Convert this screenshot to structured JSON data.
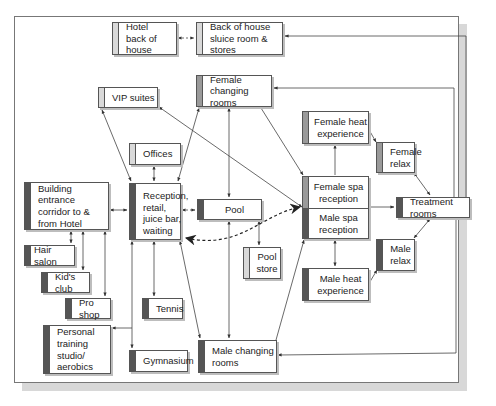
{
  "diagram": {
    "colors": {
      "bar_light": "#d9d9d9",
      "bar_mid": "#9a9a9a",
      "bar_dark": "#555555",
      "line": "#444444"
    },
    "nodes": {
      "hotel_boh": "Hotel\nback of house",
      "boh_sluice": "Back of house\nsluice room & stores",
      "vip_suites": "VIP suites",
      "female_changing": "Female\nchanging rooms",
      "offices": "Offices",
      "building_entrance": "Building entrance\ncorridor to &\nfrom Hotel",
      "reception": "Reception,\nretail,\njuice bar,\nwaiting",
      "pool": "Pool",
      "pool_store": "Pool\nstore",
      "female_spa_reception": "Female spa\nreception",
      "male_spa_reception": "Male spa\nreception",
      "female_heat": "Female heat\nexperience",
      "female_relax": "Female\nrelax",
      "treatment_rooms": "Treatment rooms",
      "male_relax": "Male\nrelax",
      "male_heat": "Male heat\nexperience",
      "hair_salon": "Hair salon",
      "kids_club": "Kid's club",
      "pro_shop": "Pro shop",
      "tennis": "Tennis",
      "personal_training": "Personal\ntraining studio/\naerobics",
      "gymnasium": "Gymnasium",
      "male_changing": "Male changing\nrooms"
    },
    "edges": [
      {
        "from": "hotel_boh",
        "to": "boh_sluice",
        "style": "dashed",
        "arrows": "both"
      },
      {
        "from": "treatment_rooms",
        "to": "boh_sluice",
        "style": "solid",
        "arrows": "end"
      },
      {
        "from": "treatment_rooms",
        "to": "female_changing",
        "style": "solid",
        "arrows": "end"
      },
      {
        "from": "treatment_rooms",
        "to": "male_changing",
        "style": "solid",
        "arrows": "end"
      },
      {
        "from": "reception",
        "to": "vip_suites",
        "style": "solid",
        "arrows": "both"
      },
      {
        "from": "reception",
        "to": "female_changing",
        "style": "solid",
        "arrows": "both"
      },
      {
        "from": "reception",
        "to": "offices",
        "style": "solid",
        "arrows": "both"
      },
      {
        "from": "building_entrance",
        "to": "reception",
        "style": "solid",
        "arrows": "both"
      },
      {
        "from": "reception",
        "to": "pool",
        "style": "dashed",
        "arrows": "both"
      },
      {
        "from": "female_changing",
        "to": "pool",
        "style": "solid",
        "arrows": "both"
      },
      {
        "from": "female_changing",
        "to": "female_spa_reception",
        "style": "solid",
        "arrows": "end"
      },
      {
        "from": "vip_suites",
        "to": "male_spa_reception",
        "style": "solid",
        "arrows": "both"
      },
      {
        "from": "pool",
        "to": "pool_store",
        "style": "solid",
        "arrows": "both"
      },
      {
        "from": "pool",
        "to": "male_changing",
        "style": "solid",
        "arrows": "both"
      },
      {
        "from": "reception",
        "to": "spa_reception",
        "style": "dashed-curve",
        "arrows": "both"
      },
      {
        "from": "female_spa_reception",
        "to": "female_heat",
        "style": "solid",
        "arrows": "end"
      },
      {
        "from": "female_heat",
        "to": "female_relax",
        "style": "solid",
        "arrows": "end"
      },
      {
        "from": "female_relax",
        "to": "treatment_rooms",
        "style": "solid",
        "arrows": "both"
      },
      {
        "from": "spa_reception",
        "to": "treatment_rooms",
        "style": "solid",
        "arrows": "end"
      },
      {
        "from": "treatment_rooms",
        "to": "male_relax",
        "style": "solid",
        "arrows": "both"
      },
      {
        "from": "male_spa_reception",
        "to": "male_heat",
        "style": "solid",
        "arrows": "both"
      },
      {
        "from": "male_heat",
        "to": "male_relax",
        "style": "solid",
        "arrows": "end"
      },
      {
        "from": "male_changing",
        "to": "male_spa_reception",
        "style": "solid",
        "arrows": "end"
      },
      {
        "from": "building_entrance",
        "to": "hair_salon",
        "style": "solid",
        "arrows": "both"
      },
      {
        "from": "building_entrance",
        "to": "kids_club",
        "style": "solid",
        "arrows": "both"
      },
      {
        "from": "building_entrance",
        "to": "pro_shop",
        "style": "solid",
        "arrows": "both"
      },
      {
        "from": "reception",
        "to": "tennis",
        "style": "solid",
        "arrows": "both"
      },
      {
        "from": "reception",
        "to": "gymnasium",
        "style": "solid",
        "arrows": "both"
      },
      {
        "from": "reception",
        "to": "personal_training",
        "style": "solid",
        "arrows": "end"
      },
      {
        "from": "reception",
        "to": "male_changing",
        "style": "solid",
        "arrows": "both"
      }
    ]
  }
}
